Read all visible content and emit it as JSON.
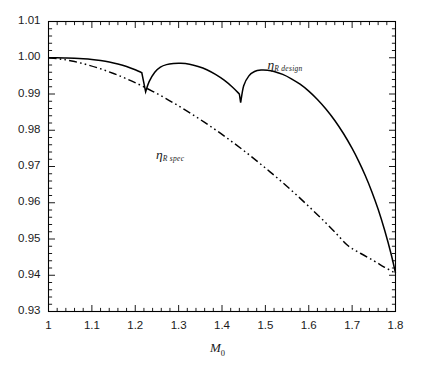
{
  "chart_data": {
    "type": "line",
    "title": "",
    "xlabel": "M0",
    "xlabel_display": "M",
    "xlabel_sub": "0",
    "ylabel": "",
    "xlim": [
      1.0,
      1.8
    ],
    "ylim": [
      0.93,
      1.01
    ],
    "xticks": [
      1,
      1.1,
      1.2,
      1.3,
      1.4,
      1.5,
      1.6,
      1.7,
      1.8
    ],
    "xtick_labels": [
      "1",
      "1.1",
      "1.2",
      "1.3",
      "1.4",
      "1.5",
      "1.6",
      "1.7",
      "1.8"
    ],
    "yticks": [
      0.93,
      0.94,
      0.95,
      0.96,
      0.97,
      0.98,
      0.99,
      1.0,
      1.01
    ],
    "ytick_labels": [
      "0.93",
      "0.94",
      "0.95",
      "0.96",
      "0.97",
      "0.98",
      "0.99",
      "1.00",
      "1.01"
    ],
    "x_minor_per_major": 5,
    "y_minor_per_major": 5,
    "grid": false,
    "legend_position": "inline-annotations",
    "line_color": "#000000",
    "series": [
      {
        "name": "eta_R_design",
        "label_display": "η",
        "label_sub": "R design",
        "style": "solid",
        "color": "#000000",
        "label_x": 1.505,
        "label_y": 0.9985,
        "points": [
          [
            1.0,
            1.0
          ],
          [
            1.02,
            1.0
          ],
          [
            1.04,
            0.99995
          ],
          [
            1.06,
            0.99988
          ],
          [
            1.08,
            0.99975
          ],
          [
            1.1,
            0.99955
          ],
          [
            1.12,
            0.99925
          ],
          [
            1.14,
            0.99885
          ],
          [
            1.16,
            0.9983
          ],
          [
            1.18,
            0.9976
          ],
          [
            1.2,
            0.9967
          ],
          [
            1.215,
            0.9959
          ],
          [
            1.224,
            0.9906
          ],
          [
            1.232,
            0.9934
          ],
          [
            1.245,
            0.996
          ],
          [
            1.258,
            0.9974
          ],
          [
            1.272,
            0.9981
          ],
          [
            1.288,
            0.9984
          ],
          [
            1.305,
            0.99845
          ],
          [
            1.325,
            0.9982
          ],
          [
            1.345,
            0.9976
          ],
          [
            1.365,
            0.9967
          ],
          [
            1.385,
            0.9954
          ],
          [
            1.405,
            0.9938
          ],
          [
            1.425,
            0.9918
          ],
          [
            1.44,
            0.99
          ],
          [
            1.443,
            0.9876
          ],
          [
            1.45,
            0.9923
          ],
          [
            1.462,
            0.995
          ],
          [
            1.475,
            0.9962
          ],
          [
            1.49,
            0.9966
          ],
          [
            1.505,
            0.99655
          ],
          [
            1.52,
            0.9962
          ],
          [
            1.54,
            0.9954
          ],
          [
            1.56,
            0.9942
          ],
          [
            1.58,
            0.9927
          ],
          [
            1.6,
            0.9908
          ],
          [
            1.62,
            0.9885
          ],
          [
            1.64,
            0.9858
          ],
          [
            1.66,
            0.9827
          ],
          [
            1.68,
            0.9791
          ],
          [
            1.7,
            0.975
          ],
          [
            1.715,
            0.9715
          ],
          [
            1.73,
            0.9676
          ],
          [
            1.745,
            0.9632
          ],
          [
            1.76,
            0.9582
          ],
          [
            1.775,
            0.9524
          ],
          [
            1.79,
            0.9458
          ],
          [
            1.8,
            0.9406
          ]
        ]
      },
      {
        "name": "eta_R_spec",
        "label_display": "η",
        "label_sub": "R spec",
        "style": "dashdot",
        "color": "#000000",
        "label_x": 1.248,
        "label_y": 0.9738,
        "points": [
          [
            1.0,
            1.0
          ],
          [
            1.03,
            0.9996
          ],
          [
            1.06,
            0.99895
          ],
          [
            1.09,
            0.99805
          ],
          [
            1.12,
            0.99695
          ],
          [
            1.15,
            0.99565
          ],
          [
            1.18,
            0.9942
          ],
          [
            1.21,
            0.99255
          ],
          [
            1.24,
            0.99075
          ],
          [
            1.27,
            0.9888
          ],
          [
            1.3,
            0.9867
          ],
          [
            1.33,
            0.9845
          ],
          [
            1.36,
            0.98215
          ],
          [
            1.39,
            0.9797
          ],
          [
            1.42,
            0.9771
          ],
          [
            1.45,
            0.9744
          ],
          [
            1.48,
            0.97155
          ],
          [
            1.51,
            0.9686
          ],
          [
            1.54,
            0.96555
          ],
          [
            1.57,
            0.96235
          ],
          [
            1.6,
            0.959
          ],
          [
            1.63,
            0.95555
          ],
          [
            1.66,
            0.95195
          ],
          [
            1.69,
            0.9482
          ],
          [
            1.72,
            0.946
          ],
          [
            1.75,
            0.944
          ],
          [
            1.775,
            0.9422
          ],
          [
            1.8,
            0.9406
          ]
        ]
      }
    ]
  },
  "axes": {
    "x_axis_title": "M",
    "x_axis_title_sub": "0"
  }
}
